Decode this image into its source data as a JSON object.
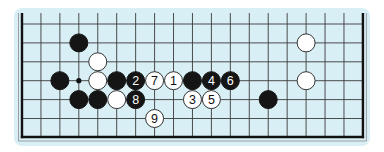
{
  "diagram": {
    "type": "go-board-partial",
    "board_size": 19,
    "visible_rows": 7,
    "colors": {
      "page_bg": "#ffffff",
      "board_bg": "#d9eff6",
      "grid_line": "#3a3a3a",
      "border": "#111111",
      "black_stone": "#151515",
      "white_stone": "#ffffff",
      "white_stone_edge": "#333333"
    },
    "star_points": [
      {
        "col": 3,
        "row": 3
      }
    ],
    "stones": [
      {
        "color": "black",
        "col": 3,
        "row": 1,
        "label": ""
      },
      {
        "color": "white",
        "col": 4,
        "row": 2,
        "label": ""
      },
      {
        "color": "white",
        "col": 15,
        "row": 1,
        "label": ""
      },
      {
        "color": "black",
        "col": 2,
        "row": 3,
        "label": ""
      },
      {
        "color": "white",
        "col": 4,
        "row": 3,
        "label": ""
      },
      {
        "color": "black",
        "col": 5,
        "row": 3,
        "label": ""
      },
      {
        "color": "black",
        "col": 6,
        "row": 3,
        "label": "2"
      },
      {
        "color": "white",
        "col": 7,
        "row": 3,
        "label": "7"
      },
      {
        "color": "white",
        "col": 8,
        "row": 3,
        "label": "1"
      },
      {
        "color": "black",
        "col": 9,
        "row": 3,
        "label": ""
      },
      {
        "color": "black",
        "col": 10,
        "row": 3,
        "label": "4"
      },
      {
        "color": "black",
        "col": 11,
        "row": 3,
        "label": "6"
      },
      {
        "color": "white",
        "col": 15,
        "row": 3,
        "label": ""
      },
      {
        "color": "black",
        "col": 3,
        "row": 4,
        "label": ""
      },
      {
        "color": "black",
        "col": 4,
        "row": 4,
        "label": ""
      },
      {
        "color": "white",
        "col": 5,
        "row": 4,
        "label": ""
      },
      {
        "color": "black",
        "col": 6,
        "row": 4,
        "label": "8"
      },
      {
        "color": "white",
        "col": 9,
        "row": 4,
        "label": "3"
      },
      {
        "color": "white",
        "col": 10,
        "row": 4,
        "label": "5"
      },
      {
        "color": "black",
        "col": 13,
        "row": 4,
        "label": ""
      },
      {
        "color": "white",
        "col": 7,
        "row": 5,
        "label": "9"
      }
    ]
  }
}
